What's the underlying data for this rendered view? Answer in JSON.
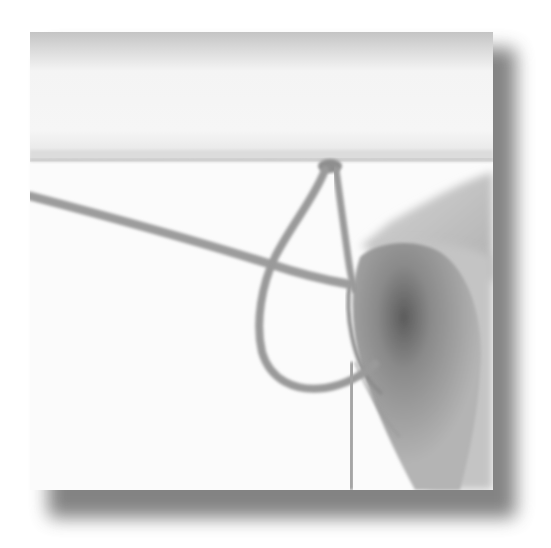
{
  "image": {
    "description": "Grayscale photograph of a hand tying a rope knot around a horizontal bar, with a soft drop shadow",
    "subject": "rope knot",
    "style": "grayscale photo with drop shadow",
    "colors": {
      "background": "#ffffff",
      "photo_light": "#fafafa",
      "top_band": "#c8c8c8",
      "rope": "#9a9a9a",
      "hand": "#a8a8a8",
      "hand_shadow": "#5a5a5a",
      "drop_shadow": "#6e6e6e"
    }
  }
}
